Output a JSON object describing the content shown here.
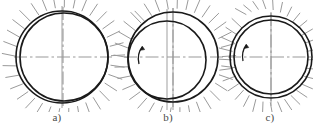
{
  "figure": {
    "type": "engineering-diagram",
    "background_color": "#ffffff",
    "line_color": "#1a1a1a",
    "hatch_color": "#9a9a9a",
    "centerline_color": "#9a9a9a",
    "axis_line_color": "#a8a8a8",
    "panels": [
      {
        "id": "a",
        "caption": "a)",
        "caption_x": 57,
        "caption_y": 115,
        "outer_circle": {
          "cx": 62,
          "cy": 57,
          "r": 46
        },
        "inner_circle": {
          "cx": 64,
          "cy": 57,
          "r": 44
        },
        "contact_side": "left",
        "eccentricity": 2,
        "has_rotation_arrow": false,
        "vertical_axis_lines": 1,
        "hatch_angle_deg": 45,
        "hatch_count": 26,
        "hatch_length": 14,
        "description": "shaft resting in bearing, contact at left, concentric centerlines"
      },
      {
        "id": "b",
        "caption": "b)",
        "caption_x": 168,
        "caption_y": 115,
        "outer_circle": {
          "cx": 173,
          "cy": 57,
          "r": 45
        },
        "inner_circle": {
          "cx": 167,
          "cy": 60,
          "r": 39
        },
        "contact_side": "lower-left",
        "eccentricity": 7,
        "has_rotation_arrow": true,
        "rotation_arrow": {
          "cx": 141,
          "cy": 54,
          "direction": "counter-clockwise"
        },
        "vertical_axis_lines": 2,
        "hatch_angle_deg": 45,
        "hatch_count": 26,
        "hatch_length": 14,
        "description": "rotating shaft displaced, offset axes, rotation arrow"
      },
      {
        "id": "c",
        "caption": "c)",
        "caption_x": 270,
        "caption_y": 115,
        "outer_circle": {
          "cx": 271,
          "cy": 57,
          "r": 41
        },
        "inner_circle": {
          "cx": 271,
          "cy": 57,
          "r": 37
        },
        "contact_side": "none",
        "eccentricity": 0,
        "has_rotation_arrow": true,
        "rotation_arrow": {
          "cx": 242,
          "cy": 52,
          "direction": "counter-clockwise"
        },
        "vertical_axis_lines": 1,
        "hatch_angle_deg": 45,
        "hatch_count": 24,
        "hatch_length": 12,
        "description": "shaft floating on full oil film, concentric position"
      }
    ]
  }
}
